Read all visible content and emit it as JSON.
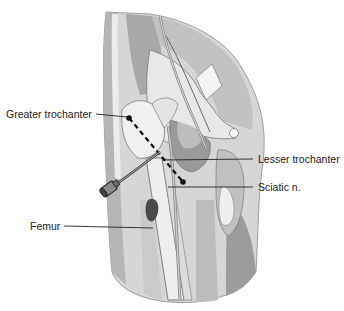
{
  "figure": {
    "labels": {
      "greater_trochanter": "Greater trochanter",
      "lesser_trochanter": "Lesser trochanter",
      "sciatic_nerve": "Sciatic n.",
      "femur": "Femur"
    }
  },
  "colors": {
    "background": "#ffffff",
    "skin_light": "#e2e2e2",
    "skin_mid": "#c8c8c8",
    "skin_dark": "#a6a6a6",
    "bone": "#ededed",
    "outline": "#555555",
    "label_text": "#222222",
    "needle": "#444444"
  }
}
